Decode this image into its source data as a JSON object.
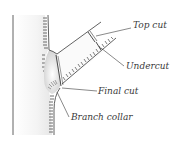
{
  "diagram": {
    "labels": {
      "top_cut": "Top cut",
      "undercut": "Undercut",
      "final_cut": "Final cut",
      "branch_collar": "Branch collar"
    },
    "colors": {
      "line": "#3a3a3a",
      "background": "#ffffff",
      "shade": "#d8d8d8"
    }
  }
}
